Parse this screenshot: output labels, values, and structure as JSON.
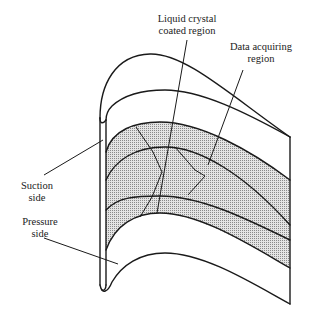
{
  "figure": {
    "labels": {
      "liquid_crystal_line1": "Liquid crystal",
      "liquid_crystal_line2": "coated region",
      "data_acquiring_line1": "Data acquiring",
      "data_acquiring_line2": "region",
      "suction_line1": "Suction",
      "suction_line2": "side",
      "pressure_line1": "Pressure",
      "pressure_line2": "side"
    },
    "colors": {
      "stroke": "#1a1a1a",
      "shade": "#bdbdbd",
      "background": "#ffffff"
    }
  }
}
